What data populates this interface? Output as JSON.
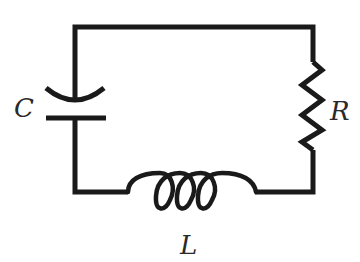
{
  "diagram": {
    "type": "series RLC circuit",
    "stroke_color": "#1a1a1a",
    "background": "#ffffff",
    "components": [
      {
        "id": "capacitor",
        "symbol": "capacitor-curved-plate",
        "label": "C",
        "position": "left"
      },
      {
        "id": "resistor",
        "symbol": "zigzag-resistor",
        "label": "R",
        "position": "right"
      },
      {
        "id": "inductor",
        "symbol": "coil-inductor",
        "label": "L",
        "position": "bottom",
        "loops": 4
      }
    ],
    "labels": {
      "capacitor": "C",
      "resistor": "R",
      "inductor": "L"
    }
  }
}
